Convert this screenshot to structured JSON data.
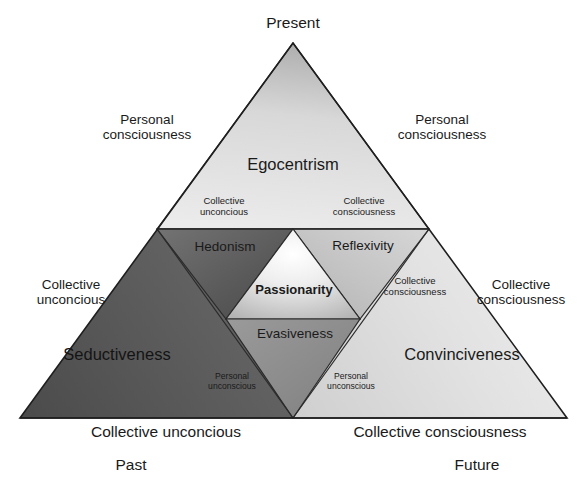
{
  "diagram": {
    "type": "nested-triangle-model",
    "apex_label": "Present",
    "bottom_left_time": "Past",
    "bottom_right_time": "Future",
    "base_left_label": "Collective unconcious",
    "base_right_label": "Collective consciousness",
    "outer_left_upper": "Personal\nconsciousness",
    "outer_right_upper": "Personal\nconsciousness",
    "outer_left_lower": "Collective\nunconcious",
    "outer_right_lower": "Collective\nconsciousness",
    "zones": {
      "top": {
        "name": "Egocentrism",
        "inner_left_label": "Collective\nunconcious",
        "inner_right_label": "Collective\nconsciousness"
      },
      "middle_left": {
        "name": "Hedonism"
      },
      "middle_right": {
        "name": "Reflexivity",
        "side_label": "Collective\nconsciousness"
      },
      "center": {
        "name": "Passionarity"
      },
      "lower_center": {
        "name": "Evasiveness"
      },
      "bottom_left": {
        "name": "Seductiveness",
        "inner_label": "Personal\nunconscious"
      },
      "bottom_right": {
        "name": "Convinciveness",
        "inner_label": "Personal\nunconscious"
      }
    },
    "palette": {
      "stroke": "#2b2b2b",
      "top_light": "#e9e9e9",
      "top_dark": "#a8a8a8",
      "dark_zone_light": "#8a8a8a",
      "dark_zone_dark": "#4a4a4a",
      "light_zone_light": "#f2f2f2",
      "light_zone_dark": "#c2c2c2",
      "core_light": "#ffffff",
      "core_dark": "#b9b9b9",
      "text": "#1a1a1a"
    }
  },
  "labels": {
    "apex_text_1": "Present",
    "p_cons_l1": "Personal",
    "p_cons_l2": "consciousness",
    "p_cons_r1": "Personal",
    "p_cons_r2": "consciousness",
    "egocentrism": "Egocentrism",
    "coll_unc_in_1": "Collective",
    "coll_unc_in_2": "unconcious",
    "coll_cons_in_1": "Collective",
    "coll_cons_in_2": "consciousness",
    "hedonism": "Hedonism",
    "reflexivity": "Reflexivity",
    "passionarity": "Passionarity",
    "evasiveness": "Evasiveness",
    "coll_unc_out_1": "Collective",
    "coll_unc_out_2": "unconcious",
    "coll_cons_out_1": "Collective",
    "coll_cons_out_2": "consciousness",
    "coll_cons_mid_1": "Collective",
    "coll_cons_mid_2": "consciousness",
    "seductiveness": "Seductiveness",
    "convinciveness": "Convinciveness",
    "pers_unc_l1": "Personal",
    "pers_unc_l2": "unconscious",
    "pers_unc_r1": "Personal",
    "pers_unc_r2": "unconscious",
    "base_left": "Collective unconcious",
    "base_right": "Collective consciousness",
    "past": "Past",
    "future": "Future"
  }
}
